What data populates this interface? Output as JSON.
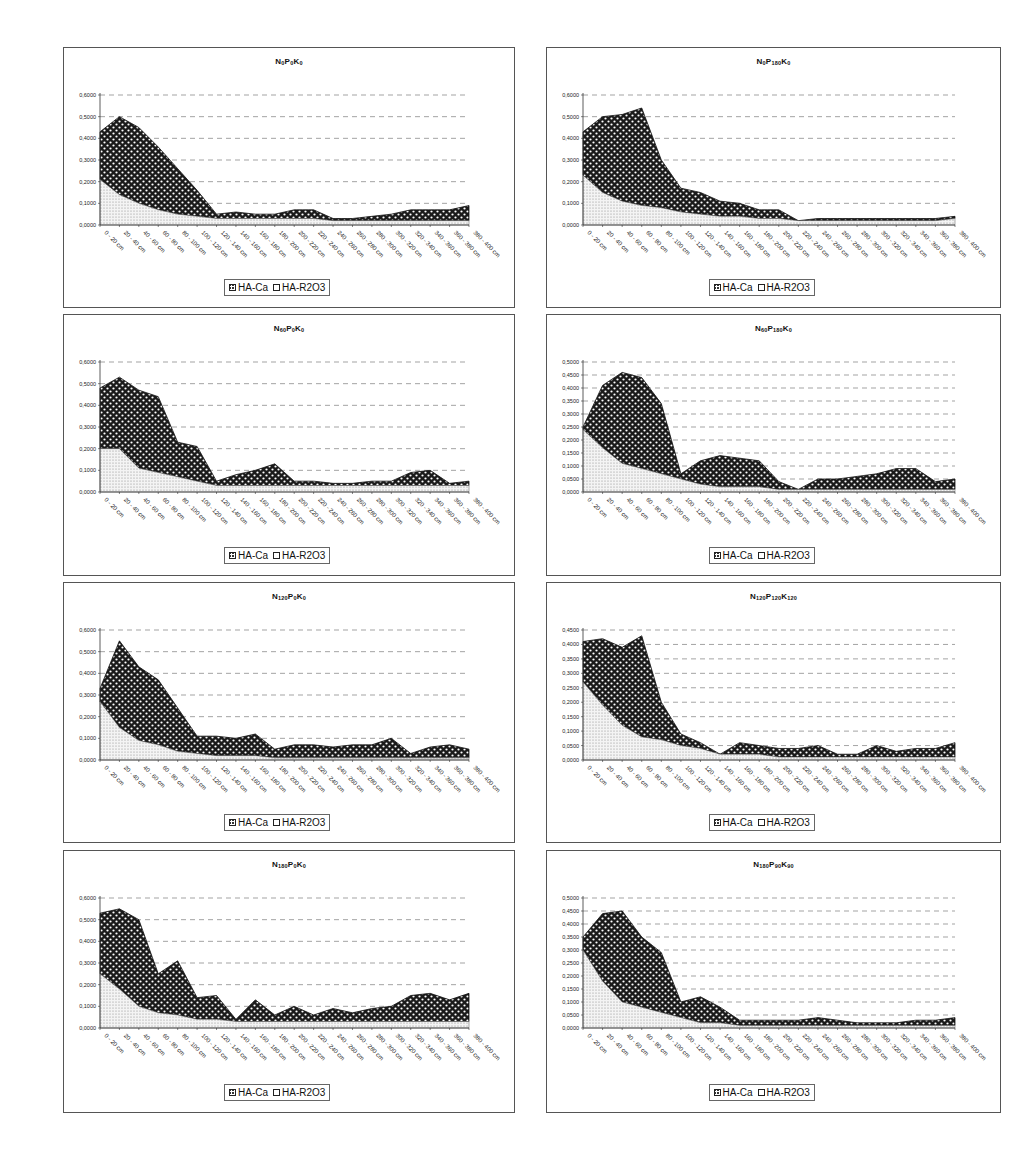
{
  "legend": {
    "series_a": "HA-Ca",
    "series_b": "HA-R2O3"
  },
  "categories": [
    "0 - 20 cm",
    "20 - 40 cm",
    "40 - 60 cm",
    "60 - 80 cm",
    "80 - 100 cm",
    "100 - 120 cm",
    "120 - 140 cm",
    "140 - 160 cm",
    "160 - 180 cm",
    "180 - 200 cm",
    "200 - 220 cm",
    "220 - 240 cm",
    "240 - 260 cm",
    "260 - 280 cm",
    "280 - 300 cm",
    "300 - 320 cm",
    "320 - 340 cm",
    "340 - 360 cm",
    "360 - 380 cm",
    "380 - 400 cm"
  ],
  "panels": [
    {
      "title_parts": [
        "N",
        "0",
        "P",
        "0",
        "K",
        "0"
      ],
      "title": "N0P0K0"
    },
    {
      "title_parts": [
        "N",
        "0",
        "P",
        "180",
        "K",
        "0"
      ],
      "title": "N0P180K0"
    },
    {
      "title_parts": [
        "N",
        "60",
        "P",
        "0",
        "K",
        "0"
      ],
      "title": "N60P0K0"
    },
    {
      "title_parts": [
        "N",
        "60",
        "P",
        "180",
        "K",
        "0"
      ],
      "title": "N60P180K0"
    },
    {
      "title_parts": [
        "N",
        "120",
        "P",
        "0",
        "K",
        "0"
      ],
      "title": "N120P0K0"
    },
    {
      "title_parts": [
        "N",
        "120",
        "P",
        "120",
        "K",
        "120"
      ],
      "title": "N120P120K120"
    },
    {
      "title_parts": [
        "N",
        "180",
        "P",
        "0",
        "K",
        "0"
      ],
      "title": "N180P0K0"
    },
    {
      "title_parts": [
        "N",
        "180",
        "P",
        "90",
        "K",
        "90"
      ],
      "title": "N180P90K90"
    }
  ],
  "chart_data": [
    {
      "type": "area",
      "stacked": true,
      "title": "N0P0K0",
      "xlabel": "",
      "ylabel": "",
      "ylim": [
        0,
        0.6
      ],
      "ytick_step": 0.1,
      "grid": "dashed horizontal",
      "legend_position": "bottom",
      "series": [
        {
          "name": "HA-R2O3",
          "values": [
            0.21,
            0.14,
            0.1,
            0.07,
            0.05,
            0.04,
            0.03,
            0.03,
            0.03,
            0.03,
            0.03,
            0.03,
            0.02,
            0.02,
            0.02,
            0.02,
            0.02,
            0.02,
            0.02,
            0.02
          ]
        },
        {
          "name": "HA-Ca",
          "values": [
            0.22,
            0.36,
            0.35,
            0.29,
            0.21,
            0.12,
            0.02,
            0.03,
            0.02,
            0.02,
            0.04,
            0.04,
            0.01,
            0.01,
            0.02,
            0.03,
            0.05,
            0.05,
            0.05,
            0.07
          ]
        }
      ]
    },
    {
      "type": "area",
      "stacked": true,
      "title": "N0P180K0",
      "xlabel": "",
      "ylabel": "",
      "ylim": [
        0,
        0.6
      ],
      "ytick_step": 0.1,
      "grid": "dashed horizontal",
      "legend_position": "bottom",
      "series": [
        {
          "name": "HA-R2O3",
          "values": [
            0.23,
            0.15,
            0.11,
            0.09,
            0.08,
            0.06,
            0.05,
            0.04,
            0.04,
            0.03,
            0.03,
            0.02,
            0.02,
            0.02,
            0.02,
            0.02,
            0.02,
            0.02,
            0.02,
            0.03
          ]
        },
        {
          "name": "HA-Ca",
          "values": [
            0.2,
            0.35,
            0.4,
            0.45,
            0.22,
            0.11,
            0.1,
            0.07,
            0.06,
            0.04,
            0.04,
            0.0,
            0.01,
            0.01,
            0.01,
            0.01,
            0.01,
            0.01,
            0.01,
            0.01
          ]
        }
      ]
    },
    {
      "type": "area",
      "stacked": true,
      "title": "N60P0K0",
      "xlabel": "",
      "ylabel": "",
      "ylim": [
        0,
        0.6
      ],
      "ytick_step": 0.1,
      "grid": "dashed horizontal",
      "legend_position": "bottom",
      "series": [
        {
          "name": "HA-R2O3",
          "values": [
            0.2,
            0.2,
            0.11,
            0.09,
            0.07,
            0.05,
            0.03,
            0.03,
            0.03,
            0.03,
            0.03,
            0.03,
            0.03,
            0.03,
            0.03,
            0.03,
            0.03,
            0.03,
            0.03,
            0.03
          ]
        },
        {
          "name": "HA-Ca",
          "values": [
            0.28,
            0.33,
            0.36,
            0.35,
            0.16,
            0.16,
            0.02,
            0.05,
            0.07,
            0.1,
            0.02,
            0.02,
            0.01,
            0.01,
            0.02,
            0.02,
            0.06,
            0.07,
            0.01,
            0.02
          ]
        }
      ]
    },
    {
      "type": "area",
      "stacked": true,
      "title": "N60P180K0",
      "xlabel": "",
      "ylabel": "",
      "ylim": [
        0,
        0.5
      ],
      "ytick_step": 0.05,
      "grid": "dashed horizontal",
      "legend_position": "bottom",
      "series": [
        {
          "name": "HA-R2O3",
          "values": [
            0.24,
            0.17,
            0.11,
            0.09,
            0.07,
            0.05,
            0.03,
            0.02,
            0.02,
            0.02,
            0.01,
            0.01,
            0.01,
            0.01,
            0.01,
            0.01,
            0.01,
            0.01,
            0.01,
            0.01
          ]
        },
        {
          "name": "HA-Ca",
          "values": [
            0.01,
            0.24,
            0.35,
            0.35,
            0.27,
            0.02,
            0.09,
            0.12,
            0.11,
            0.1,
            0.03,
            0.0,
            0.04,
            0.04,
            0.05,
            0.06,
            0.08,
            0.08,
            0.03,
            0.04
          ]
        }
      ]
    },
    {
      "type": "area",
      "stacked": true,
      "title": "N120P0K0",
      "xlabel": "",
      "ylabel": "",
      "ylim": [
        0,
        0.6
      ],
      "ytick_step": 0.1,
      "grid": "dashed horizontal",
      "legend_position": "bottom",
      "series": [
        {
          "name": "HA-R2O3",
          "values": [
            0.27,
            0.15,
            0.09,
            0.07,
            0.04,
            0.03,
            0.02,
            0.02,
            0.02,
            0.01,
            0.01,
            0.01,
            0.01,
            0.01,
            0.01,
            0.01,
            0.01,
            0.01,
            0.01,
            0.01
          ]
        },
        {
          "name": "HA-Ca",
          "values": [
            0.06,
            0.4,
            0.34,
            0.3,
            0.2,
            0.08,
            0.09,
            0.08,
            0.1,
            0.04,
            0.06,
            0.06,
            0.05,
            0.06,
            0.06,
            0.09,
            0.02,
            0.05,
            0.06,
            0.04
          ]
        }
      ]
    },
    {
      "type": "area",
      "stacked": true,
      "title": "N120P120K120",
      "xlabel": "",
      "ylabel": "",
      "ylim": [
        0,
        0.45
      ],
      "ytick_step": 0.05,
      "grid": "dashed horizontal",
      "legend_position": "bottom",
      "series": [
        {
          "name": "HA-R2O3",
          "values": [
            0.27,
            0.19,
            0.12,
            0.08,
            0.07,
            0.05,
            0.04,
            0.02,
            0.02,
            0.02,
            0.01,
            0.01,
            0.01,
            0.01,
            0.01,
            0.01,
            0.01,
            0.01,
            0.01,
            0.01
          ]
        },
        {
          "name": "HA-Ca",
          "values": [
            0.14,
            0.23,
            0.27,
            0.35,
            0.13,
            0.04,
            0.02,
            0.0,
            0.04,
            0.03,
            0.03,
            0.03,
            0.04,
            0.01,
            0.01,
            0.04,
            0.02,
            0.03,
            0.03,
            0.05
          ]
        }
      ]
    },
    {
      "type": "area",
      "stacked": true,
      "title": "N180P0K0",
      "xlabel": "",
      "ylabel": "",
      "ylim": [
        0,
        0.6
      ],
      "ytick_step": 0.1,
      "grid": "dashed horizontal",
      "legend_position": "bottom",
      "series": [
        {
          "name": "HA-R2O3",
          "values": [
            0.25,
            0.18,
            0.1,
            0.07,
            0.06,
            0.04,
            0.04,
            0.03,
            0.03,
            0.03,
            0.03,
            0.03,
            0.03,
            0.03,
            0.03,
            0.03,
            0.03,
            0.03,
            0.03,
            0.03
          ]
        },
        {
          "name": "HA-Ca",
          "values": [
            0.28,
            0.37,
            0.4,
            0.18,
            0.25,
            0.1,
            0.11,
            0.01,
            0.1,
            0.03,
            0.07,
            0.03,
            0.06,
            0.04,
            0.06,
            0.07,
            0.12,
            0.13,
            0.1,
            0.13
          ]
        }
      ]
    },
    {
      "type": "area",
      "stacked": true,
      "title": "N180P90K90",
      "xlabel": "",
      "ylabel": "",
      "ylim": [
        0,
        0.5
      ],
      "ytick_step": 0.05,
      "grid": "dashed horizontal",
      "legend_position": "bottom",
      "series": [
        {
          "name": "HA-R2O3",
          "values": [
            0.3,
            0.18,
            0.1,
            0.08,
            0.06,
            0.04,
            0.02,
            0.02,
            0.01,
            0.01,
            0.01,
            0.01,
            0.01,
            0.01,
            0.01,
            0.01,
            0.01,
            0.01,
            0.01,
            0.01
          ]
        },
        {
          "name": "HA-Ca",
          "values": [
            0.05,
            0.26,
            0.35,
            0.27,
            0.23,
            0.06,
            0.1,
            0.06,
            0.02,
            0.02,
            0.02,
            0.02,
            0.03,
            0.02,
            0.01,
            0.01,
            0.01,
            0.02,
            0.02,
            0.03
          ]
        }
      ]
    }
  ]
}
